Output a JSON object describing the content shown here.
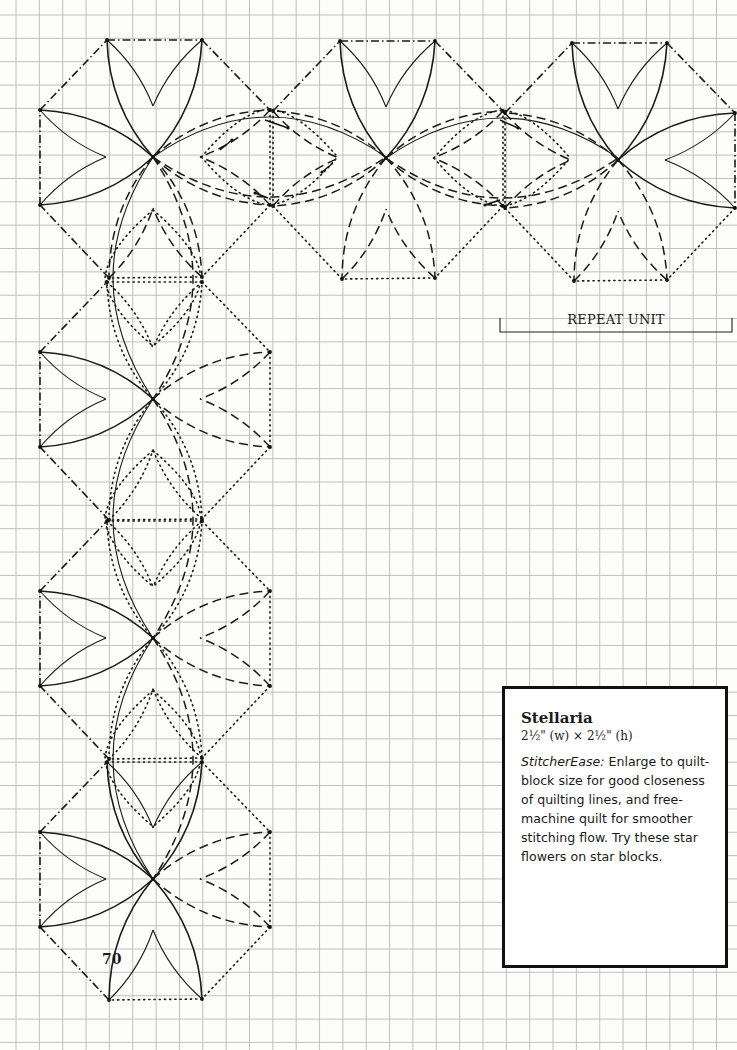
{
  "page": {
    "number": "70",
    "background": "#fdfdfc",
    "grid": {
      "color": "#b9b9b9",
      "spacing_px": 23.35,
      "offset_x": 16,
      "offset_y": 15
    }
  },
  "pattern": {
    "name": "Stellaria",
    "line_styles": [
      "solid",
      "dashed",
      "dotted",
      "dash-dot"
    ],
    "repeat_unit_label": "REPEAT UNIT",
    "top_row_centers": [
      [
        153,
        157
      ],
      [
        386,
        158
      ],
      [
        618,
        160
      ]
    ],
    "left_column_centers": [
      [
        153,
        399
      ],
      [
        153,
        638
      ],
      [
        153,
        879
      ]
    ],
    "unit": {
      "half_width": 115,
      "half_height": 119,
      "inner_offset": 46,
      "notch_depth": 68
    }
  },
  "info_box": {
    "title": "Stellaria",
    "size": "2½\" (w) × 2½\" (h)",
    "body_label": "StitcherEase:",
    "body_text": " Enlarge to quilt-block size for good closeness of quilting lines, and free-machine quilt for smoother stitching flow. Try these star flowers on star blocks."
  }
}
